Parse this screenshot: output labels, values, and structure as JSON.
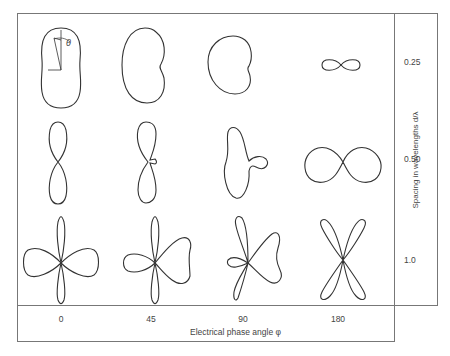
{
  "figure": {
    "x_axis": {
      "title": "Electrical phase angle φ",
      "ticks": [
        "0",
        "45",
        "90",
        "180"
      ]
    },
    "y_axis": {
      "title": "Spacing in wavelengths d/λ",
      "ticks": [
        "0.25",
        "0.50",
        "1.0"
      ]
    },
    "inset_annotation": "θ",
    "patterns": [
      {
        "spacing": "0.25",
        "phase": "0",
        "shape": "oval-elongated-vertical"
      },
      {
        "spacing": "0.25",
        "phase": "45",
        "shape": "kidney-cardioid-like"
      },
      {
        "spacing": "0.25",
        "phase": "90",
        "shape": "cardioid"
      },
      {
        "spacing": "0.25",
        "phase": "180",
        "shape": "small-figure-eight-horizontal"
      },
      {
        "spacing": "0.50",
        "phase": "0",
        "shape": "figure-eight-vertical"
      },
      {
        "spacing": "0.50",
        "phase": "45",
        "shape": "figure-eight-vertical-small-sidelobe"
      },
      {
        "spacing": "0.50",
        "phase": "90",
        "shape": "main-lobe-with-side-lobe"
      },
      {
        "spacing": "0.50",
        "phase": "180",
        "shape": "figure-eight-horizontal"
      },
      {
        "spacing": "1.0",
        "phase": "0",
        "shape": "four-lobe-cross"
      },
      {
        "spacing": "1.0",
        "phase": "45",
        "shape": "four-lobe-asymmetric"
      },
      {
        "spacing": "1.0",
        "phase": "90",
        "shape": "multi-lobe-asymmetric"
      },
      {
        "spacing": "1.0",
        "phase": "180",
        "shape": "four-lobe-x"
      }
    ]
  }
}
